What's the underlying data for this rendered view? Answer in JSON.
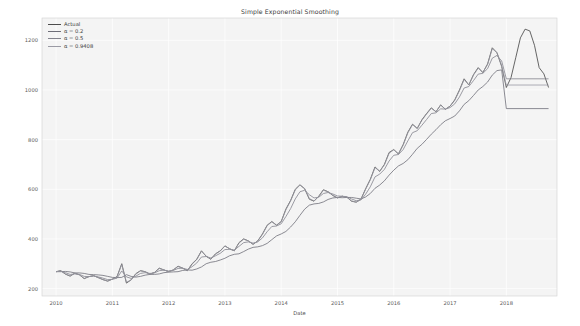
{
  "figure": {
    "background": "#ffffff",
    "axes_background": "#f4f4f4",
    "grid_color": "#ffffff"
  },
  "chart_data": {
    "type": "line",
    "title": "Simple Exponential Smoothing",
    "xlabel": "Date",
    "ylabel": "",
    "grid": true,
    "legend_position": "upper left",
    "xlim": [
      2009.75,
      2018.9
    ],
    "ylim": [
      170,
      1290
    ],
    "yticks": [
      200,
      400,
      600,
      800,
      1000,
      1200
    ],
    "ytick_labels": [
      "200",
      "400",
      "600",
      "800",
      "1000",
      "1200"
    ],
    "xticks": [
      2010,
      2011,
      2012,
      2013,
      2014,
      2015,
      2016,
      2017,
      2018
    ],
    "xtick_labels": [
      "2010",
      "2011",
      "2012",
      "2013",
      "2014",
      "2015",
      "2016",
      "2017",
      "2018"
    ],
    "colors": {
      "actual": "#4c4c4c",
      "alpha_02": "#6e6e78",
      "alpha_05": "#83838d",
      "alpha_09408": "#9a9aa4"
    },
    "series": [
      {
        "name": "Actual",
        "color": "#4c4c4c",
        "linewidth": 0.85,
        "x": [
          2010.0,
          2010.083,
          2010.167,
          2010.25,
          2010.333,
          2010.417,
          2010.5,
          2010.583,
          2010.667,
          2010.75,
          2010.833,
          2010.917,
          2011.0,
          2011.083,
          2011.167,
          2011.25,
          2011.333,
          2011.417,
          2011.5,
          2011.583,
          2011.667,
          2011.75,
          2011.833,
          2011.917,
          2012.0,
          2012.083,
          2012.167,
          2012.25,
          2012.333,
          2012.417,
          2012.5,
          2012.583,
          2012.667,
          2012.75,
          2012.833,
          2012.917,
          2013.0,
          2013.083,
          2013.167,
          2013.25,
          2013.333,
          2013.417,
          2013.5,
          2013.583,
          2013.667,
          2013.75,
          2013.833,
          2013.917,
          2014.0,
          2014.083,
          2014.167,
          2014.25,
          2014.333,
          2014.417,
          2014.5,
          2014.583,
          2014.667,
          2014.75,
          2014.833,
          2014.917,
          2015.0,
          2015.083,
          2015.167,
          2015.25,
          2015.333,
          2015.417,
          2015.5,
          2015.583,
          2015.667,
          2015.75,
          2015.833,
          2015.917,
          2016.0,
          2016.083,
          2016.167,
          2016.25,
          2016.333,
          2016.417,
          2016.5,
          2016.583,
          2016.667,
          2016.75,
          2016.833,
          2016.917,
          2017.0,
          2017.083,
          2017.167,
          2017.25,
          2017.333,
          2017.417,
          2017.5,
          2017.583,
          2017.667,
          2017.75,
          2017.833,
          2017.917,
          2018.0,
          2018.083,
          2018.167,
          2018.25,
          2018.333,
          2018.417,
          2018.5,
          2018.583,
          2018.667,
          2018.75
        ],
        "y": [
          268,
          272,
          258,
          250,
          262,
          255,
          240,
          248,
          252,
          244,
          236,
          230,
          238,
          248,
          300,
          222,
          235,
          260,
          272,
          268,
          258,
          265,
          282,
          275,
          268,
          275,
          290,
          282,
          272,
          300,
          318,
          352,
          330,
          318,
          340,
          352,
          372,
          360,
          352,
          385,
          400,
          392,
          378,
          392,
          420,
          455,
          470,
          455,
          470,
          520,
          555,
          600,
          618,
          602,
          560,
          552,
          572,
          598,
          590,
          575,
          565,
          572,
          568,
          552,
          548,
          560,
          602,
          640,
          690,
          672,
          700,
          748,
          760,
          742,
          780,
          830,
          862,
          845,
          880,
          905,
          928,
          912,
          940,
          922,
          935,
          960,
          1000,
          1045,
          1020,
          1062,
          1090,
          1070,
          1105,
          1170,
          1150,
          1095,
          1010,
          1050,
          1130,
          1210,
          1245,
          1238,
          1180,
          1090,
          1065,
          1010
        ]
      },
      {
        "name": "α = 0.2",
        "color": "#6e6e78",
        "linewidth": 0.8,
        "forecast_level": 925,
        "x": [
          2010.0,
          2010.083,
          2010.167,
          2010.25,
          2010.333,
          2010.417,
          2010.5,
          2010.583,
          2010.667,
          2010.75,
          2010.833,
          2010.917,
          2011.0,
          2011.083,
          2011.167,
          2011.25,
          2011.333,
          2011.417,
          2011.5,
          2011.583,
          2011.667,
          2011.75,
          2011.833,
          2011.917,
          2012.0,
          2012.083,
          2012.167,
          2012.25,
          2012.333,
          2012.417,
          2012.5,
          2012.583,
          2012.667,
          2012.75,
          2012.833,
          2012.917,
          2013.0,
          2013.083,
          2013.167,
          2013.25,
          2013.333,
          2013.417,
          2013.5,
          2013.583,
          2013.667,
          2013.75,
          2013.833,
          2013.917,
          2014.0,
          2014.083,
          2014.167,
          2014.25,
          2014.333,
          2014.417,
          2014.5,
          2014.583,
          2014.667,
          2014.75,
          2014.833,
          2014.917,
          2015.0,
          2015.083,
          2015.167,
          2015.25,
          2015.333,
          2015.417,
          2015.5,
          2015.583,
          2015.667,
          2015.75,
          2015.833,
          2015.917,
          2016.0,
          2016.083,
          2016.167,
          2016.25,
          2016.333,
          2016.417,
          2016.5,
          2016.583,
          2016.667,
          2016.75,
          2016.833,
          2016.917,
          2017.0,
          2017.083,
          2017.167,
          2017.25,
          2017.333,
          2017.417,
          2017.5,
          2017.583,
          2017.667,
          2017.75,
          2017.833,
          2017.917,
          2018.0,
          2018.75
        ],
        "y": [
          268,
          268,
          269,
          267,
          263,
          263,
          261,
          257,
          256,
          255,
          253,
          249,
          245,
          244,
          245,
          256,
          249,
          246,
          249,
          254,
          257,
          257,
          259,
          264,
          266,
          267,
          268,
          273,
          275,
          274,
          279,
          287,
          300,
          306,
          309,
          315,
          322,
          332,
          338,
          340,
          349,
          359,
          366,
          368,
          373,
          382,
          397,
          412,
          420,
          430,
          448,
          469,
          495,
          520,
          536,
          541,
          543,
          549,
          559,
          565,
          567,
          566,
          567,
          567,
          564,
          561,
          569,
          583,
          604,
          617,
          634,
          657,
          677,
          694,
          704,
          719,
          741,
          765,
          781,
          801,
          822,
          840,
          860,
          876,
          885,
          895,
          916,
          942,
          957,
          978,
          1000,
          1014,
          1032,
          1060,
          1078,
          1081,
          925,
          925
        ]
      },
      {
        "name": "α = 0.5",
        "color": "#83838d",
        "linewidth": 0.8,
        "forecast_level": 1045,
        "x": [
          2010.0,
          2010.083,
          2010.167,
          2010.25,
          2010.333,
          2010.417,
          2010.5,
          2010.583,
          2010.667,
          2010.75,
          2010.833,
          2010.917,
          2011.0,
          2011.083,
          2011.167,
          2011.25,
          2011.333,
          2011.417,
          2011.5,
          2011.583,
          2011.667,
          2011.75,
          2011.833,
          2011.917,
          2012.0,
          2012.083,
          2012.167,
          2012.25,
          2012.333,
          2012.417,
          2012.5,
          2012.583,
          2012.667,
          2012.75,
          2012.833,
          2012.917,
          2013.0,
          2013.083,
          2013.167,
          2013.25,
          2013.333,
          2013.417,
          2013.5,
          2013.583,
          2013.667,
          2013.75,
          2013.833,
          2013.917,
          2014.0,
          2014.083,
          2014.167,
          2014.25,
          2014.333,
          2014.417,
          2014.5,
          2014.583,
          2014.667,
          2014.75,
          2014.833,
          2014.917,
          2015.0,
          2015.083,
          2015.167,
          2015.25,
          2015.333,
          2015.417,
          2015.5,
          2015.583,
          2015.667,
          2015.75,
          2015.833,
          2015.917,
          2016.0,
          2016.083,
          2016.167,
          2016.25,
          2016.333,
          2016.417,
          2016.5,
          2016.583,
          2016.667,
          2016.75,
          2016.833,
          2016.917,
          2017.0,
          2017.083,
          2017.167,
          2017.25,
          2017.333,
          2017.417,
          2017.5,
          2017.583,
          2017.667,
          2017.75,
          2017.833,
          2017.917,
          2018.0,
          2018.75
        ],
        "y": [
          268,
          270,
          264,
          257,
          259,
          257,
          249,
          248,
          250,
          247,
          242,
          236,
          237,
          242,
          271,
          247,
          241,
          250,
          261,
          264,
          261,
          263,
          272,
          274,
          271,
          273,
          281,
          282,
          277,
          288,
          303,
          327,
          329,
          323,
          332,
          342,
          357,
          358,
          355,
          370,
          385,
          388,
          383,
          388,
          404,
          429,
          450,
          452,
          461,
          490,
          522,
          561,
          590,
          596,
          578,
          565,
          568,
          583,
          587,
          581,
          573,
          572,
          570,
          561,
          554,
          557,
          580,
          610,
          650,
          661,
          680,
          714,
          737,
          740,
          760,
          795,
          828,
          836,
          858,
          881,
          905,
          908,
          924,
          923,
          929,
          944,
          972,
          1008,
          1014,
          1038,
          1064,
          1067,
          1086,
          1128,
          1139,
          1117,
          1045,
          1045
        ]
      },
      {
        "name": "α = 0.9408",
        "color": "#9a9aa4",
        "linewidth": 0.8,
        "forecast_level": 1020,
        "x": [
          2010.0,
          2010.083,
          2010.167,
          2010.25,
          2010.333,
          2010.417,
          2010.5,
          2010.583,
          2010.667,
          2010.75,
          2010.833,
          2010.917,
          2011.0,
          2011.083,
          2011.167,
          2011.25,
          2011.333,
          2011.417,
          2011.5,
          2011.583,
          2011.667,
          2011.75,
          2011.833,
          2011.917,
          2012.0,
          2012.083,
          2012.167,
          2012.25,
          2012.333,
          2012.417,
          2012.5,
          2012.583,
          2012.667,
          2012.75,
          2012.833,
          2012.917,
          2013.0,
          2013.083,
          2013.167,
          2013.25,
          2013.333,
          2013.417,
          2013.5,
          2013.583,
          2013.667,
          2013.75,
          2013.833,
          2013.917,
          2014.0,
          2014.083,
          2014.167,
          2014.25,
          2014.333,
          2014.417,
          2014.5,
          2014.583,
          2014.667,
          2014.75,
          2014.833,
          2014.917,
          2015.0,
          2015.083,
          2015.167,
          2015.25,
          2015.333,
          2015.417,
          2015.5,
          2015.583,
          2015.667,
          2015.75,
          2015.833,
          2015.917,
          2016.0,
          2016.083,
          2016.167,
          2016.25,
          2016.333,
          2016.417,
          2016.5,
          2016.583,
          2016.667,
          2016.75,
          2016.833,
          2016.917,
          2017.0,
          2017.083,
          2017.167,
          2017.25,
          2017.333,
          2017.417,
          2017.5,
          2017.583,
          2017.667,
          2017.75,
          2017.833,
          2017.917,
          2018.0,
          2018.75
        ],
        "y": [
          268,
          271,
          259,
          251,
          261,
          255,
          241,
          248,
          252,
          244,
          236,
          230,
          238,
          247,
          297,
          226,
          234,
          258,
          271,
          268,
          258,
          265,
          281,
          275,
          268,
          275,
          289,
          282,
          273,
          298,
          317,
          350,
          331,
          319,
          339,
          351,
          371,
          361,
          352,
          383,
          399,
          392,
          379,
          391,
          418,
          453,
          469,
          456,
          469,
          517,
          553,
          597,
          617,
          603,
          563,
          553,
          571,
          596,
          590,
          576,
          566,
          572,
          568,
          553,
          548,
          559,
          600,
          638,
          687,
          673,
          698,
          745,
          759,
          743,
          778,
          827,
          860,
          846,
          878,
          903,
          926,
          913,
          939,
          923,
          934,
          958,
          997,
          1042,
          1021,
          1060,
          1088,
          1071,
          1103,
          1166,
          1151,
          1098,
          1020,
          1020
        ]
      }
    ]
  },
  "legend": {
    "entries": [
      {
        "label": "Actual",
        "color": "#4c4c4c"
      },
      {
        "label": "α = 0.2",
        "color": "#6e6e78"
      },
      {
        "label": "α = 0.5",
        "color": "#83838d"
      },
      {
        "label": "α = 0.9408",
        "color": "#9a9aa4"
      }
    ]
  }
}
